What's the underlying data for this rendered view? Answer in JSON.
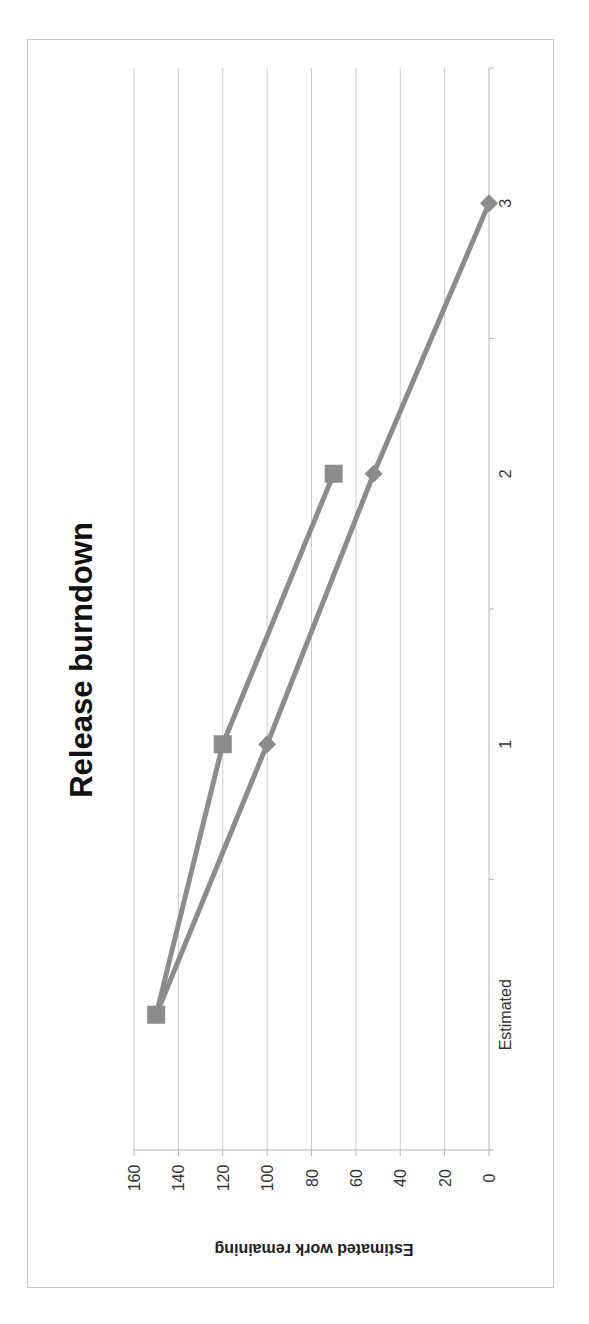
{
  "chart_data": {
    "type": "line",
    "title": "Release burndown",
    "xlabel": "",
    "ylabel": "Estimated work remaining",
    "categories": [
      "Estimated",
      "1",
      "2",
      "3"
    ],
    "series": [
      {
        "name": "Series 1",
        "marker": "square",
        "values": [
          150,
          120,
          70,
          null
        ]
      },
      {
        "name": "Series 2",
        "marker": "diamond",
        "values": [
          150,
          100,
          52,
          0
        ]
      }
    ],
    "ylim": [
      0,
      160
    ],
    "yticks": [
      0,
      20,
      40,
      60,
      80,
      100,
      120,
      140,
      160
    ],
    "grid": true,
    "legend": "none",
    "rotation": "90deg clockwise",
    "colors": {
      "line": "#8c8c8c",
      "marker": "#8c8c8c",
      "grid": "#cccccc",
      "frame": "#c9c9c9"
    }
  }
}
